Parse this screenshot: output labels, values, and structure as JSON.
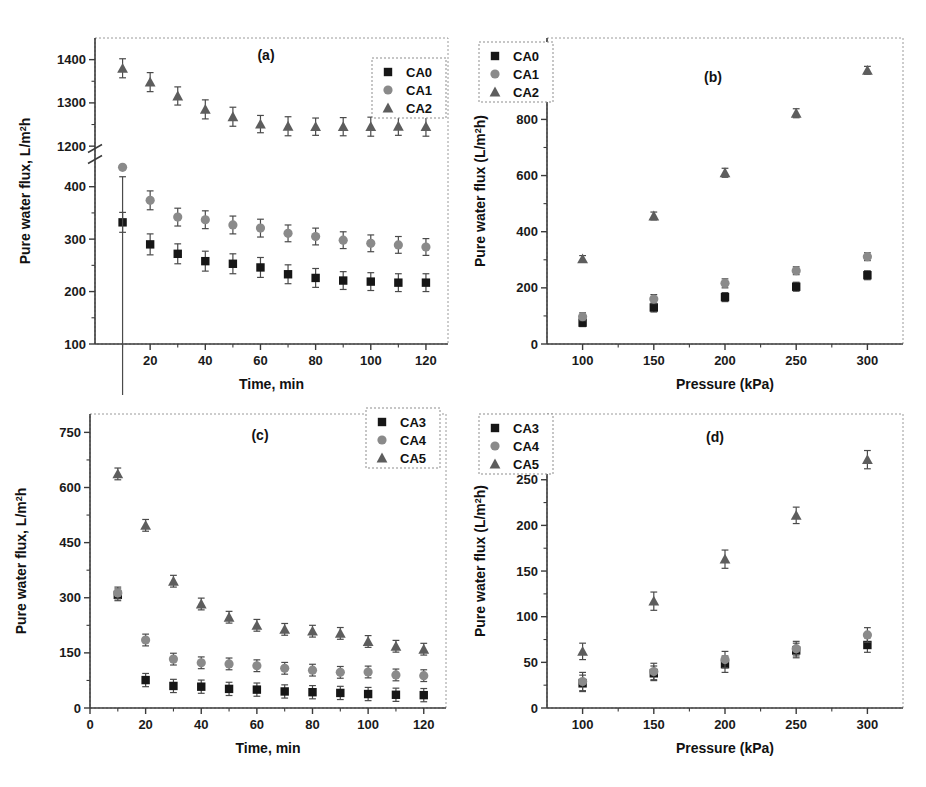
{
  "figure": {
    "panels": [
      "a",
      "b",
      "c",
      "d"
    ],
    "colors": {
      "CA0": "#161616",
      "CA1": "#8a8a8a",
      "CA2": "#5d5d5d",
      "CA3": "#161616",
      "CA4": "#8a8a8a",
      "CA5": "#5d5d5d",
      "axis": "#3b3b3b"
    }
  },
  "chart_data": [
    {
      "type": "scatter",
      "panel": "a",
      "tag": "(a)",
      "title": "",
      "xlabel": "Time, min",
      "ylabel": "Pure water flux, L/m²h",
      "ylabel_parts": {
        "pre": "Pure water flux, L/m",
        "sup": "2",
        "post": "h"
      },
      "x": [
        10,
        20,
        30,
        40,
        50,
        60,
        70,
        80,
        90,
        100,
        110,
        120
      ],
      "xlim": [
        0,
        128
      ],
      "xticks": [
        20,
        40,
        60,
        80,
        100,
        120
      ],
      "xticklabels": [
        "20",
        "40",
        "60",
        "80",
        "100",
        "120"
      ],
      "ylim": [
        100,
        1450
      ],
      "yticks": [
        100,
        200,
        300,
        400,
        1200,
        1300,
        1400
      ],
      "yticklabels": [
        "100",
        "200",
        "300",
        "400",
        "1200",
        "1300",
        "1400"
      ],
      "axis_break": {
        "present": true,
        "lower_top": 450,
        "upper_bottom": 1190
      },
      "grid": false,
      "legend_position": "top-right",
      "series": [
        {
          "name": "CA0",
          "marker": "square",
          "color": "#161616",
          "values": [
            332,
            290,
            272,
            258,
            253,
            246,
            233,
            226,
            221,
            219,
            217,
            217
          ],
          "errors": [
            19,
            20,
            19,
            19,
            19,
            19,
            18,
            18,
            17,
            17,
            17,
            17
          ]
        },
        {
          "name": "CA1",
          "marker": "circle",
          "color": "#8a8a8a",
          "values": [
            437,
            374,
            342,
            337,
            327,
            321,
            311,
            305,
            298,
            292,
            289,
            285
          ],
          "errors": [
            18,
            18,
            17,
            17,
            17,
            17,
            16,
            16,
            16,
            16,
            16,
            16
          ]
        },
        {
          "name": "CA2",
          "marker": "triangle",
          "color": "#5d5d5d",
          "values": [
            1380,
            1348,
            1316,
            1285,
            1268,
            1251,
            1246,
            1245,
            1245,
            1245,
            1246,
            1245
          ],
          "errors": [
            22,
            22,
            21,
            22,
            22,
            20,
            22,
            20,
            21,
            22,
            21,
            22
          ]
        }
      ]
    },
    {
      "type": "scatter",
      "panel": "b",
      "tag": "(b)",
      "title": "",
      "xlabel": "Pressure (kPa)",
      "ylabel": "Pure water flux (L/m²h)",
      "ylabel_parts": {
        "pre": "Pure water flux (L/m",
        "sup": "2",
        "post": "h)"
      },
      "x": [
        100,
        150,
        200,
        250,
        300
      ],
      "xlim": [
        75,
        325
      ],
      "xticks": [
        100,
        150,
        200,
        250,
        300
      ],
      "xticklabels": [
        "100",
        "150",
        "200",
        "250",
        "300"
      ],
      "ylim": [
        0,
        1090
      ],
      "yticks": [
        0,
        200,
        400,
        600,
        800,
        1000
      ],
      "yticklabels": [
        "0",
        "200",
        "400",
        "600",
        "800",
        "1000"
      ],
      "grid": false,
      "legend_position": "top-left",
      "series": [
        {
          "name": "CA0",
          "marker": "square",
          "color": "#161616",
          "values": [
            76,
            130,
            167,
            204,
            245
          ],
          "errors": [
            14,
            16,
            16,
            16,
            16
          ]
        },
        {
          "name": "CA1",
          "marker": "circle",
          "color": "#8a8a8a",
          "values": [
            97,
            160,
            216,
            261,
            311
          ],
          "errors": [
            14,
            16,
            16,
            14,
            14
          ]
        },
        {
          "name": "CA2",
          "marker": "triangle",
          "color": "#5d5d5d",
          "values": [
            303,
            456,
            610,
            822,
            975
          ],
          "errors": [
            12,
            14,
            16,
            16,
            14
          ]
        }
      ]
    },
    {
      "type": "scatter",
      "panel": "c",
      "tag": "(c)",
      "title": "",
      "xlabel": "Time, min",
      "ylabel": "Pure water flux, L/m²h",
      "ylabel_parts": {
        "pre": "Pure water flux, L/m",
        "sup": "2",
        "post": "h"
      },
      "x": [
        10,
        20,
        30,
        40,
        50,
        60,
        70,
        80,
        90,
        100,
        110,
        120
      ],
      "xlim": [
        0,
        128
      ],
      "xticks": [
        0,
        20,
        40,
        60,
        80,
        100,
        120
      ],
      "xticklabels": [
        "0",
        "20",
        "40",
        "60",
        "80",
        "100",
        "120"
      ],
      "ylim": [
        0,
        800
      ],
      "yticks": [
        0,
        150,
        300,
        450,
        600,
        750
      ],
      "yticklabels": [
        "0",
        "150",
        "300",
        "450",
        "600",
        "750"
      ],
      "grid": false,
      "legend_position": "top-right",
      "series": [
        {
          "name": "CA3",
          "marker": "square",
          "color": "#161616",
          "values": [
            308,
            76,
            60,
            58,
            52,
            50,
            45,
            43,
            41,
            38,
            36,
            35
          ],
          "errors": [
            16,
            18,
            18,
            18,
            18,
            18,
            18,
            18,
            18,
            18,
            18,
            18
          ]
        },
        {
          "name": "CA4",
          "marker": "circle",
          "color": "#8a8a8a",
          "values": [
            313,
            185,
            133,
            123,
            120,
            115,
            108,
            103,
            97,
            98,
            90,
            88
          ],
          "errors": [
            16,
            16,
            16,
            16,
            16,
            16,
            16,
            16,
            16,
            16,
            16,
            16
          ]
        },
        {
          "name": "CA5",
          "marker": "triangle",
          "color": "#5d5d5d",
          "values": [
            637,
            497,
            345,
            283,
            247,
            225,
            214,
            209,
            203,
            181,
            168,
            160
          ],
          "errors": [
            16,
            16,
            16,
            16,
            16,
            16,
            16,
            16,
            16,
            16,
            16,
            16
          ]
        }
      ]
    },
    {
      "type": "scatter",
      "panel": "d",
      "tag": "(d)",
      "title": "",
      "xlabel": "Pressure (kPa)",
      "ylabel": "Pure water flux (L/m²h)",
      "ylabel_parts": {
        "pre": "Pure water flux (L/m",
        "sup": "2",
        "post": "h)"
      },
      "x": [
        100,
        150,
        200,
        250,
        300
      ],
      "xlim": [
        75,
        325
      ],
      "xticks": [
        100,
        150,
        200,
        250,
        300
      ],
      "xticklabels": [
        "100",
        "150",
        "200",
        "250",
        "300"
      ],
      "ylim": [
        0,
        322
      ],
      "yticks": [
        0,
        50,
        100,
        150,
        200,
        250,
        300
      ],
      "yticklabels": [
        "0",
        "50",
        "100",
        "150",
        "200",
        "250",
        "300"
      ],
      "grid": false,
      "legend_position": "top-left",
      "series": [
        {
          "name": "CA3",
          "marker": "square",
          "color": "#161616",
          "values": [
            27,
            38,
            48,
            63,
            69
          ],
          "errors": [
            9,
            8,
            9,
            8,
            8
          ]
        },
        {
          "name": "CA4",
          "marker": "circle",
          "color": "#8a8a8a",
          "values": [
            29,
            40,
            53,
            65,
            80
          ],
          "errors": [
            10,
            9,
            9,
            8,
            8
          ]
        },
        {
          "name": "CA5",
          "marker": "triangle",
          "color": "#5d5d5d",
          "values": [
            62,
            117,
            163,
            211,
            272
          ],
          "errors": [
            9,
            10,
            10,
            9,
            10
          ]
        }
      ]
    }
  ]
}
